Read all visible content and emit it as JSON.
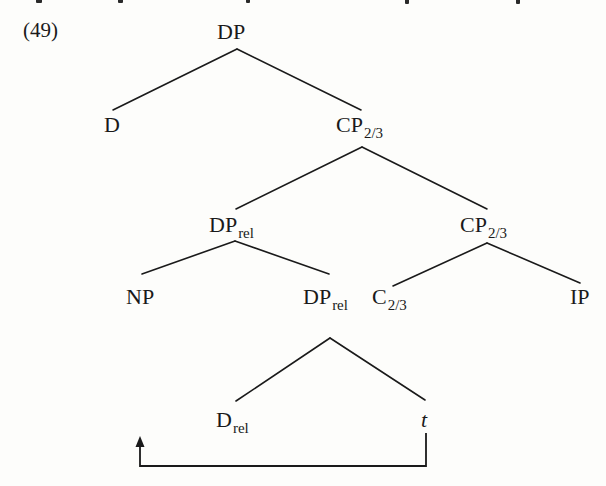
{
  "example": {
    "number": "(49)"
  },
  "tree": {
    "nodes": {
      "root": {
        "label": "DP",
        "sub": ""
      },
      "d": {
        "label": "D",
        "sub": ""
      },
      "cp_top": {
        "label": "CP",
        "sub": "2/3"
      },
      "dp_rel_upper": {
        "label": "DP",
        "sub": "rel"
      },
      "cp_lower": {
        "label": "CP",
        "sub": "2/3"
      },
      "np": {
        "label": "NP",
        "sub": ""
      },
      "dp_rel_lower": {
        "label": "DP",
        "sub": "rel"
      },
      "c": {
        "label": "C",
        "sub": "2/3"
      },
      "ip": {
        "label": "IP",
        "sub": ""
      },
      "d_rel": {
        "label": "D",
        "sub": "rel"
      },
      "trace": {
        "label": "t",
        "sub": ""
      }
    },
    "edges": [
      [
        "root",
        "d"
      ],
      [
        "root",
        "cp_top"
      ],
      [
        "cp_top",
        "dp_rel_upper"
      ],
      [
        "cp_top",
        "cp_lower"
      ],
      [
        "dp_rel_upper",
        "np"
      ],
      [
        "dp_rel_upper",
        "dp_rel_lower"
      ],
      [
        "cp_lower",
        "c"
      ],
      [
        "cp_lower",
        "ip"
      ],
      [
        "dp_rel_lower",
        "d_rel"
      ],
      [
        "dp_rel_lower",
        "trace"
      ]
    ],
    "movement_arrow": {
      "from": "trace",
      "to": "d_rel",
      "style": "bracket-arrow-below"
    }
  },
  "colors": {
    "ink": "#1a1a1a",
    "background": "#fdfdfb"
  }
}
